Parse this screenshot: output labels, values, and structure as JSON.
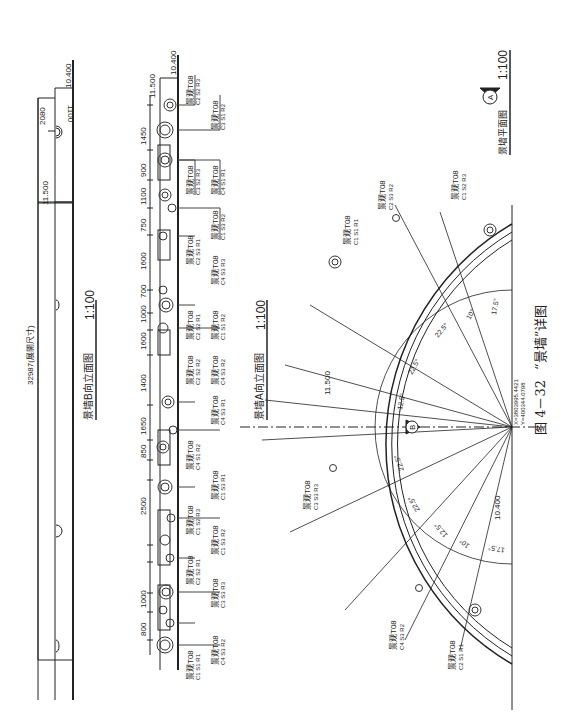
{
  "figure": {
    "caption_number": "图 4－32",
    "caption_title": "“景墙”详图"
  },
  "elevation_b": {
    "title": "景墙B向立面图",
    "scale": "1:100",
    "overall_dimension": "32987(展開尺寸)",
    "levels": [
      "10.400",
      "11.500"
    ],
    "top_offsets": [
      "1100",
      "2080"
    ],
    "dimensions": [
      "1100",
      "1450",
      "900",
      "1100",
      "750",
      "1600",
      "700",
      "1000",
      "700",
      "1600",
      "1400",
      "1650",
      "850",
      "850",
      "2500",
      "600",
      "1000",
      "800",
      "1000",
      "800"
    ],
    "sub_dimensions": [
      "250",
      "250",
      "600",
      "450",
      "800",
      "450",
      "500",
      "209",
      "250",
      "200",
      "350",
      "300",
      "100"
    ],
    "lights": [
      {
        "model": "景观T08",
        "code": "C2 S2 R3"
      },
      {
        "model": "景观T08",
        "code": "C3 S1 R2"
      },
      {
        "model": "景观T08",
        "code": "C3 S2 R3"
      },
      {
        "model": "景观T08",
        "code": "C4 S1 R1"
      },
      {
        "model": "景观T08",
        "code": "C1 S3 R2"
      },
      {
        "model": "景观T08",
        "code": "C2 S3 R1"
      },
      {
        "model": "景观T08",
        "code": "C4 S3 R3"
      },
      {
        "model": "景观T08",
        "code": "C2 S2 R1"
      },
      {
        "model": "景观T08",
        "code": "C1 S1 R2"
      },
      {
        "model": "景观T08",
        "code": "C2 S2 R2"
      },
      {
        "model": "景观T08",
        "code": "C4 S3 R2"
      },
      {
        "model": "景观T08",
        "code": "C4 S3 R1"
      },
      {
        "model": "景观T08",
        "code": "C4 S1 R2"
      },
      {
        "model": "景观T08",
        "code": "C1 S2 R3"
      },
      {
        "model": "景观T08",
        "code": "C1 S3 R1"
      },
      {
        "model": "景观T08",
        "code": "C1 S3 R2"
      },
      {
        "model": "景观T08",
        "code": "C2 S2 R1"
      },
      {
        "model": "景观T08",
        "code": "C3 S3 R3"
      },
      {
        "model": "景观T08",
        "code": "C4 S3 R2"
      },
      {
        "model": "景观T08",
        "code": "C1 S1 R1"
      }
    ]
  },
  "elevation_a": {
    "title": "景墙A向立面图",
    "scale": "1:100",
    "levels": [
      "10.400",
      "11.500"
    ]
  },
  "plan": {
    "title": "景墙平面图",
    "scale": "1:100",
    "marker_a": "A",
    "marker_b": "B",
    "center_coords": [
      "X=3803995.4421",
      "Y=400344.0798"
    ],
    "level": "10.400",
    "level_top": "11.500",
    "angles_upper": [
      "17.5°",
      "10°",
      "22.5°",
      "22.5°",
      "12.5°",
      "5°",
      "5°"
    ],
    "angles_lower": [
      "22.5°",
      "22.5°",
      "12.5°",
      "10°",
      "17.5°"
    ],
    "dims": [
      "2100",
      "200",
      "1458",
      "1901",
      "300",
      "2701",
      "300",
      "1501",
      "50",
      "2100",
      "200",
      "150",
      "250"
    ],
    "lights": [
      {
        "model": "景观T08",
        "code": "C1 S1 R1"
      },
      {
        "model": "景观T08",
        "code": "C2 S3 R2"
      },
      {
        "model": "景观T08",
        "code": "C1 S2 R3"
      },
      {
        "model": "景观T08",
        "code": "C3 S3 R3"
      },
      {
        "model": "景观T08",
        "code": "C4 S3 R2"
      },
      {
        "model": "景观T08",
        "code": "C2 S1 R1"
      }
    ]
  }
}
